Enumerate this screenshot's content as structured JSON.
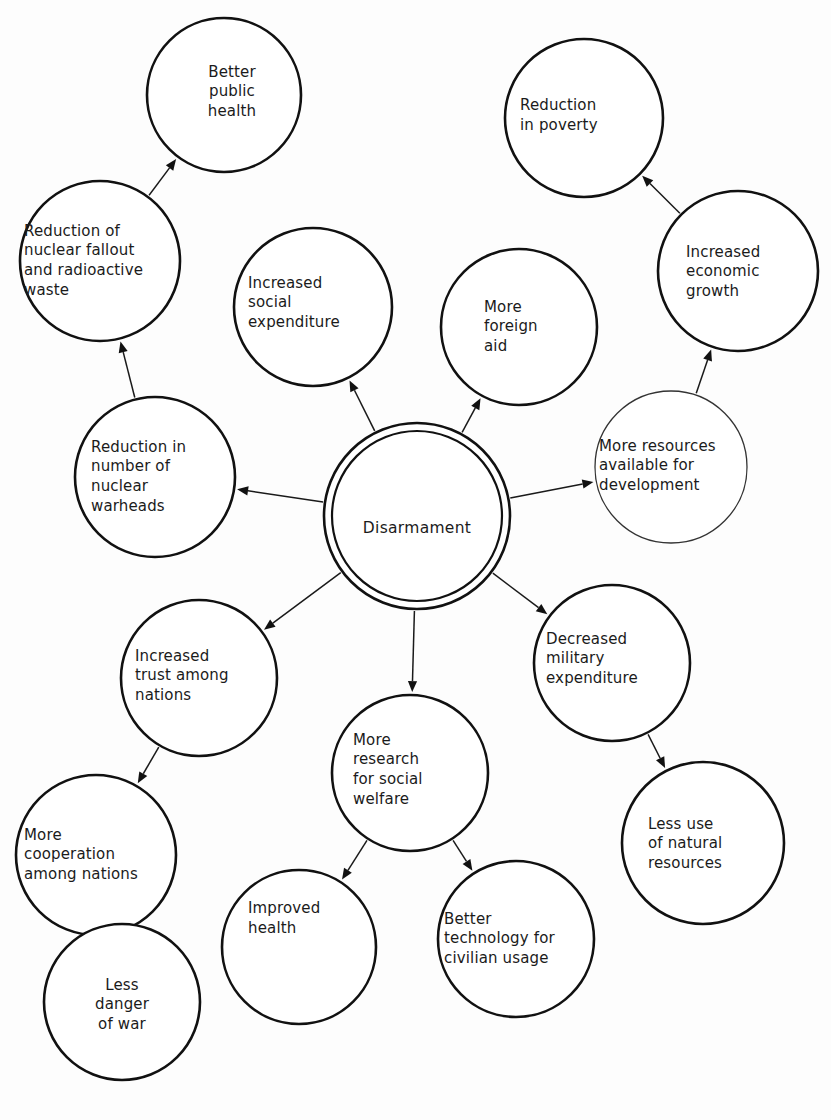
{
  "diagram": {
    "type": "concept-map",
    "background_color": "#fdfdfd",
    "stroke_color": "#111111",
    "text_color": "#1b1b1b",
    "center_node_id": "disarmament",
    "nodes": [
      {
        "id": "better-public-health",
        "label": "Better\npublic\nhealth",
        "cx": 224,
        "cy": 95,
        "r": 77,
        "align": "center",
        "style": "bold",
        "label_w": 110,
        "label_dx": 8,
        "label_dy": -3
      },
      {
        "id": "reduction-nuclear-fallout",
        "label": "Reduction of\nnuclear fallout\nand radioactive\nwaste",
        "cx": 100,
        "cy": 261,
        "r": 80,
        "align": "left",
        "style": "bold",
        "label_w": 148,
        "label_dx": -2,
        "label_dy": 0
      },
      {
        "id": "increased-social-expenditure",
        "label": "Increased\nsocial\nexpenditure",
        "cx": 313,
        "cy": 307,
        "r": 79,
        "align": "left",
        "style": "bold",
        "label_w": 122,
        "label_dx": -4,
        "label_dy": -4
      },
      {
        "id": "more-foreign-aid",
        "label": "More\nforeign\naid",
        "cx": 519,
        "cy": 327,
        "r": 78,
        "align": "left",
        "style": "bold",
        "label_w": 78,
        "label_dx": 4,
        "label_dy": 0
      },
      {
        "id": "reduction-in-poverty",
        "label": "Reduction\nin poverty",
        "cx": 584,
        "cy": 118,
        "r": 79,
        "align": "left",
        "style": "bold",
        "label_w": 104,
        "label_dx": -12,
        "label_dy": -2
      },
      {
        "id": "increased-economic-growth",
        "label": "Increased\neconomic\ngrowth",
        "cx": 738,
        "cy": 271,
        "r": 80,
        "align": "left",
        "style": "bold",
        "label_w": 100,
        "label_dx": -2,
        "label_dy": 1
      },
      {
        "id": "more-resources-development",
        "label": "More resources\navailable for\ndevelopment",
        "cx": 671,
        "cy": 467,
        "r": 76,
        "align": "left",
        "style": "thin",
        "label_w": 140,
        "label_dx": -2,
        "label_dy": -1
      },
      {
        "id": "reduction-nuclear-warheads",
        "label": "Reduction in\nnumber of\nnuclear\nwarheads",
        "cx": 155,
        "cy": 477,
        "r": 80,
        "align": "left",
        "style": "bold",
        "label_w": 124,
        "label_dx": -2,
        "label_dy": 0
      },
      {
        "id": "disarmament",
        "label": "Disarmament",
        "cx": 417,
        "cy": 516,
        "r": 93,
        "r_inner": 85,
        "align": "center",
        "style": "double",
        "label_w": 160,
        "label_dx": 0,
        "label_dy": 12
      },
      {
        "id": "increased-trust-nations",
        "label": "Increased\ntrust among\nnations",
        "cx": 199,
        "cy": 678,
        "r": 78,
        "align": "left",
        "style": "bold",
        "label_w": 116,
        "label_dx": -6,
        "label_dy": -2
      },
      {
        "id": "more-cooperation-nations",
        "label": "More\ncooperation\namong nations",
        "cx": 96,
        "cy": 855,
        "r": 80,
        "align": "left",
        "style": "bold",
        "label_w": 140,
        "label_dx": -2,
        "label_dy": 0
      },
      {
        "id": "less-danger-of-war",
        "label": "Less\ndanger\nof war",
        "cx": 122,
        "cy": 1002,
        "r": 78,
        "align": "center",
        "style": "bold",
        "label_w": 100,
        "label_dx": 0,
        "label_dy": 3
      },
      {
        "id": "more-research-social-welfare",
        "label": "More\nresearch\nfor social\nwelfare",
        "cx": 410,
        "cy": 773,
        "r": 78,
        "align": "left",
        "style": "bold",
        "label_w": 102,
        "label_dx": -6,
        "label_dy": -3
      },
      {
        "id": "improved-health",
        "label": "Improved\nhealth",
        "cx": 299,
        "cy": 947,
        "r": 77,
        "align": "left",
        "style": "bold",
        "label_w": 98,
        "label_dx": -2,
        "label_dy": -28
      },
      {
        "id": "better-technology-civilian",
        "label": "Better\ntechnology for\ncivilian usage",
        "cx": 516,
        "cy": 939,
        "r": 78,
        "align": "left",
        "style": "bold",
        "label_w": 140,
        "label_dx": -2,
        "label_dy": 0
      },
      {
        "id": "decreased-military-expenditure",
        "label": "Decreased\nmilitary\nexpenditure",
        "cx": 612,
        "cy": 663,
        "r": 78,
        "align": "left",
        "style": "bold",
        "label_w": 120,
        "label_dx": -6,
        "label_dy": -4
      },
      {
        "id": "less-use-natural-resources",
        "label": "Less use\nof natural\nresources",
        "cx": 703,
        "cy": 843,
        "r": 81,
        "align": "left",
        "style": "bold",
        "label_w": 110,
        "label_dx": 0,
        "label_dy": 1
      }
    ],
    "edges": [
      {
        "id": "e-dis-warheads",
        "from": "disarmament",
        "to": "reduction-nuclear-warheads",
        "label": ""
      },
      {
        "id": "e-dis-social",
        "from": "disarmament",
        "to": "increased-social-expenditure",
        "label": ""
      },
      {
        "id": "e-dis-foreign",
        "from": "disarmament",
        "to": "more-foreign-aid",
        "label": ""
      },
      {
        "id": "e-dis-resources",
        "from": "disarmament",
        "to": "more-resources-development",
        "label": ""
      },
      {
        "id": "e-dis-military",
        "from": "disarmament",
        "to": "decreased-military-expenditure",
        "label": ""
      },
      {
        "id": "e-dis-research",
        "from": "disarmament",
        "to": "more-research-social-welfare",
        "label": ""
      },
      {
        "id": "e-dis-trust",
        "from": "disarmament",
        "to": "increased-trust-nations",
        "label": ""
      },
      {
        "id": "e-warheads-fallout",
        "from": "reduction-nuclear-warheads",
        "to": "reduction-nuclear-fallout",
        "label": ""
      },
      {
        "id": "e-fallout-health",
        "from": "reduction-nuclear-fallout",
        "to": "better-public-health",
        "label": ""
      },
      {
        "id": "e-resources-growth",
        "from": "more-resources-development",
        "to": "increased-economic-growth",
        "label": ""
      },
      {
        "id": "e-growth-poverty",
        "from": "increased-economic-growth",
        "to": "reduction-in-poverty",
        "label": ""
      },
      {
        "id": "e-military-natural",
        "from": "decreased-military-expenditure",
        "to": "less-use-natural-resources",
        "label": ""
      },
      {
        "id": "e-research-improved",
        "from": "more-research-social-welfare",
        "to": "improved-health",
        "label": ""
      },
      {
        "id": "e-research-tech",
        "from": "more-research-social-welfare",
        "to": "better-technology-civilian",
        "label": ""
      },
      {
        "id": "e-trust-coop",
        "from": "increased-trust-nations",
        "to": "more-cooperation-nations",
        "label": ""
      },
      {
        "id": "e-coop-war",
        "from": "more-cooperation-nations",
        "to": "less-danger-of-war",
        "label": ""
      }
    ]
  }
}
